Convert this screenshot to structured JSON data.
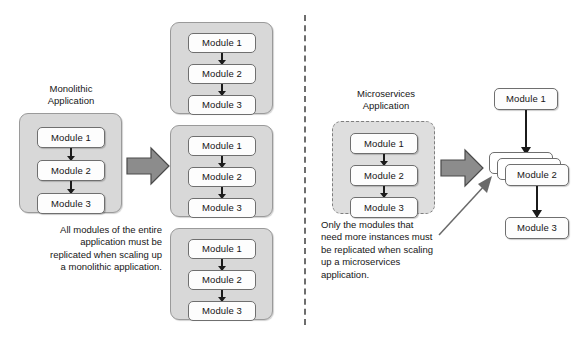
{
  "diagram": {
    "module_labels": {
      "m1": "Module 1",
      "m2": "Module 2",
      "m3": "Module 3"
    },
    "left_panel": {
      "title": "Monolithic\nApplication",
      "title_line1": "Monolithic",
      "title_line2": "Application",
      "caption": "All modules of the entire application must be replicated when scaling up a monolithic application.",
      "caption_lines": [
        "All modules of the entire",
        "application must be",
        "replicated when scaling up",
        "a monolithic application."
      ],
      "source_modules": [
        "Module 1",
        "Module 2",
        "Module 3"
      ],
      "replicas": [
        [
          "Module 1",
          "Module 2",
          "Module 3"
        ],
        [
          "Module 1",
          "Module 2",
          "Module 3"
        ],
        [
          "Module 1",
          "Module 2",
          "Module 3"
        ]
      ],
      "replica_count": 3
    },
    "right_panel": {
      "title_line1": "Microservices",
      "title_line2": "Application",
      "caption": "Only the modules that need more instances must be replicated when scaling up a microservices application.",
      "caption_lines": [
        "Only the modules that",
        "need more instances must",
        "be replicated when scaling",
        "up a microservices",
        "application."
      ],
      "source_modules": [
        "Module 1",
        "Module 2",
        "Module 3"
      ],
      "scaled_modules": [
        {
          "label": "Module 1",
          "instances": 1
        },
        {
          "label": "Module 2",
          "instances": 3
        },
        {
          "label": "Module 3",
          "instances": 1
        }
      ]
    },
    "colors": {
      "container_fill": "#d8d8d8",
      "container_stroke": "#9a9a9a",
      "module_fill": "#fdfdfd",
      "module_stroke": "#6f6f6f",
      "arrow_fill": "#8c8c8c",
      "arrow_stroke": "#4a4a4a",
      "connector": "#1b1b1b",
      "divider": "#6d6d6d",
      "page_background": "#ffffff"
    }
  }
}
